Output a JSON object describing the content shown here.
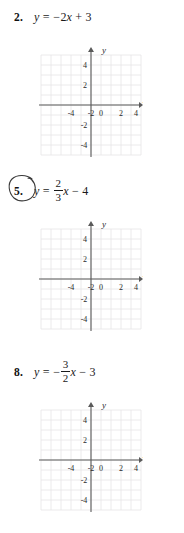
{
  "page": {
    "type": "math-worksheet",
    "background": "#ffffff",
    "width": 184,
    "height": 533
  },
  "style": {
    "grid_color": "#e6e4e6",
    "axis_color": "#5a5a5a",
    "text_color": "#161616",
    "annotation_color": "#3a3a3a"
  },
  "graph_template": {
    "x_axis_label": "x",
    "y_axis_label": "y",
    "x_ticks": [
      "-4",
      "-2",
      "0",
      "2",
      "4"
    ],
    "y_ticks": [
      "4",
      "2",
      "-2",
      "-4"
    ],
    "x_range": [
      -5,
      5
    ],
    "y_range": [
      -5,
      5
    ],
    "grid": true,
    "grid_step": 1,
    "arrows": [
      "x-positive",
      "y-positive"
    ]
  },
  "problems": [
    {
      "number": "2.",
      "circled": false,
      "equation": {
        "lhs": "y",
        "equals": "=",
        "slope_sign": "−",
        "slope": "2",
        "slope_is_fraction": false,
        "variable": "x",
        "const_sign": "+",
        "constant": "3",
        "plain": "y = -2x + 3"
      }
    },
    {
      "number": "5.",
      "circled": true,
      "equation": {
        "lhs": "y",
        "equals": "=",
        "slope_sign": "",
        "slope_is_fraction": true,
        "numerator": "2",
        "denominator": "3",
        "variable": "x",
        "const_sign": "−",
        "constant": "4",
        "plain": "y = 2/3 x - 4"
      }
    },
    {
      "number": "8.",
      "circled": false,
      "equation": {
        "lhs": "y",
        "equals": "=",
        "slope_sign": "−",
        "slope_is_fraction": true,
        "numerator": "3",
        "denominator": "2",
        "variable": "x",
        "const_sign": "−",
        "constant": "3",
        "plain": "y = -3/2 x - 3"
      }
    }
  ]
}
